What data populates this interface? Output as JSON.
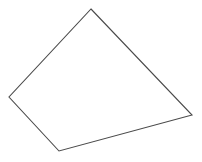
{
  "canvas": {
    "width": 202,
    "height": 162,
    "background_color": "#ffffff",
    "label": "Quadrilateral line drawing"
  },
  "shape": {
    "name": "quadrilateral",
    "kind": "convex-quadrilateral",
    "stroke_color": "#4a4a4a",
    "fill_color": "#ffffff",
    "stroke_width": 1.1,
    "closed": true,
    "points_attr": "91,9 192,115 59,151 9,97",
    "vertices": [
      {
        "label": "top-apex",
        "x": 91,
        "y": 9
      },
      {
        "label": "right",
        "x": 192,
        "y": 115
      },
      {
        "label": "bottom",
        "x": 59,
        "y": 151
      },
      {
        "label": "left",
        "x": 9,
        "y": 97
      }
    ],
    "edges": [
      {
        "label": "top-right-edge",
        "from": "top-apex",
        "to": "right"
      },
      {
        "label": "bottom-right-edge",
        "from": "right",
        "to": "bottom"
      },
      {
        "label": "bottom-left-edge",
        "from": "bottom",
        "to": "left"
      },
      {
        "label": "top-left-edge",
        "from": "left",
        "to": "top-apex"
      }
    ]
  }
}
